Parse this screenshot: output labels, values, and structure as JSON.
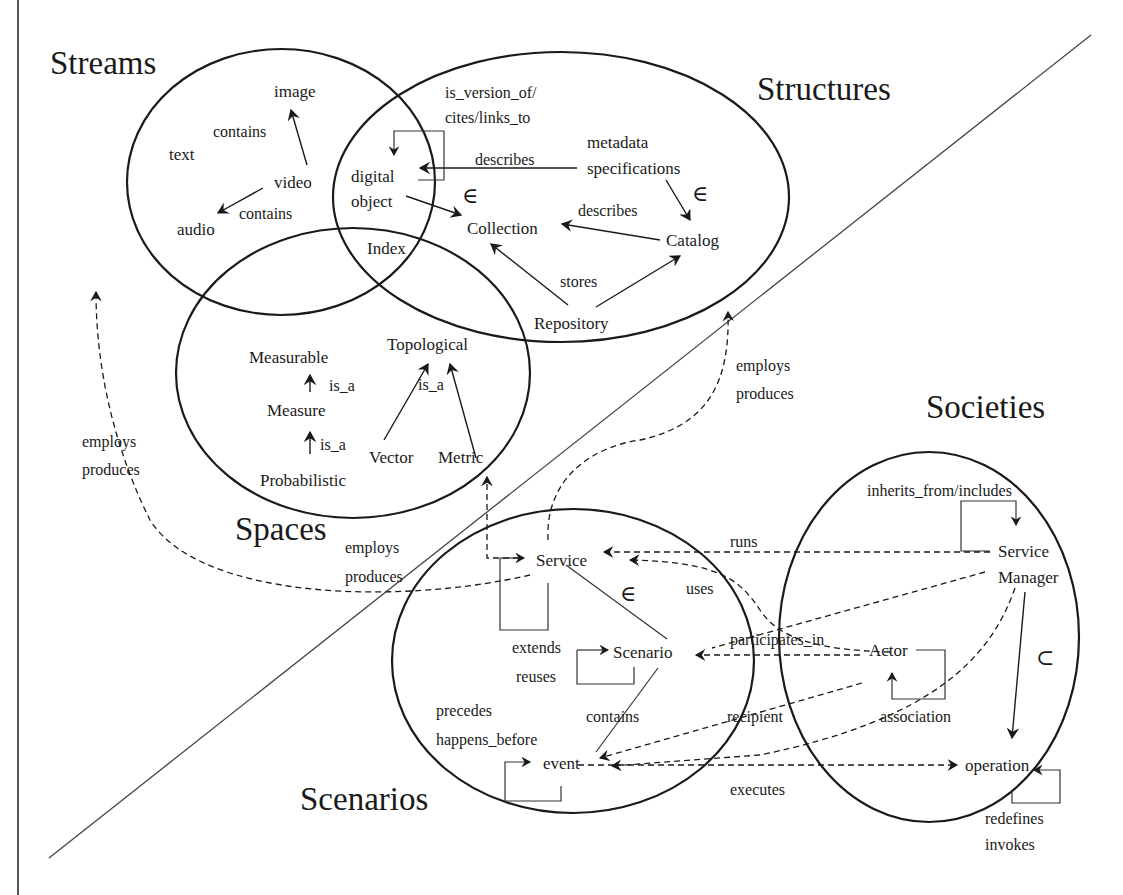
{
  "diagram": {
    "type": "5S digital library concept map",
    "regions": {
      "streams": {
        "title": "Streams",
        "nodes": [
          "text",
          "image",
          "video",
          "audio"
        ],
        "edges": [
          {
            "from": "video",
            "to": "image",
            "label": "contains"
          },
          {
            "from": "video",
            "to": "audio",
            "label": "contains"
          }
        ]
      },
      "structures": {
        "title": "Structures",
        "nodes": [
          "digital object",
          "metadata specifications",
          "Collection",
          "Catalog",
          "Repository",
          "Index"
        ]
      },
      "spaces": {
        "title": "Spaces",
        "nodes": [
          "Measurable",
          "Measure",
          "Probabilistic",
          "Topological",
          "Vector",
          "Metric"
        ]
      },
      "scenarios": {
        "title": "Scenarios",
        "nodes": [
          "Service",
          "Scenario",
          "event"
        ]
      },
      "societies": {
        "title": "Societies",
        "nodes": [
          "Service Manager",
          "Actor",
          "operation"
        ]
      }
    },
    "labels": {
      "streams_title": "Streams",
      "structures_title": "Structures",
      "spaces_title": "Spaces",
      "scenarios_title": "Scenarios",
      "societies_title": "Societies",
      "text": "text",
      "image": "image",
      "video": "video",
      "audio": "audio",
      "contains_1": "contains",
      "contains_2": "contains",
      "digital": "digital",
      "object": "object",
      "index": "Index",
      "is_version_of": "is_version_of/",
      "cites_links_to": "cites/links_to",
      "describes_1": "describes",
      "describes_2": "describes",
      "metadata": "metadata",
      "specifications": "specifications",
      "element_of_1": "∈",
      "element_of_2": "∈",
      "element_of_3": "∈",
      "subset_of": "⊂",
      "collection": "Collection",
      "catalog": "Catalog",
      "stores": "stores",
      "repository": "Repository",
      "measurable": "Measurable",
      "is_a_1": "is_a",
      "measure": "Measure",
      "is_a_2": "is_a",
      "probabilistic": "Probabilistic",
      "topological": "Topological",
      "is_a_3": "is_a",
      "vector": "Vector",
      "metric": "Metric",
      "employs_1": "employs",
      "produces_1": "produces",
      "employs_2": "employs",
      "produces_2": "produces",
      "employs_3": "employs",
      "produces_3": "produces",
      "service": "Service",
      "runs": "runs",
      "uses": "uses",
      "extends": "extends",
      "reuses": "reuses",
      "scenario": "Scenario",
      "participates_in": "participates_in",
      "precedes": "precedes",
      "happens_before": "happens_before",
      "contains_3": "contains",
      "event": "event",
      "recipient": "recipient",
      "executes": "executes",
      "inherits_from": "inherits_from/includes",
      "service_mgr_1": "Service",
      "service_mgr_2": "Manager",
      "actor": "Actor",
      "association": "association",
      "operation": "operation",
      "redefines": "redefines",
      "invokes": "invokes"
    },
    "colors": {
      "ink": "#1a1a1a",
      "background": "#ffffff"
    }
  }
}
